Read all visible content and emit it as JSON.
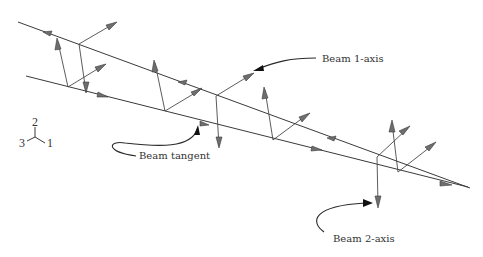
{
  "figure": {
    "title_cropped": "",
    "labels": {
      "beam_1_axis": "Beam 1-axis",
      "beam_2_axis": "Beam 2-axis",
      "beam_tangent": "Beam tangent"
    },
    "triad": {
      "axis_1": "1",
      "axis_2": "2",
      "axis_3": "3"
    },
    "colors": {
      "line": "#3a3a3a",
      "arrowhead": "#6e6e6e",
      "text": "#333333",
      "background": "#ffffff"
    }
  }
}
